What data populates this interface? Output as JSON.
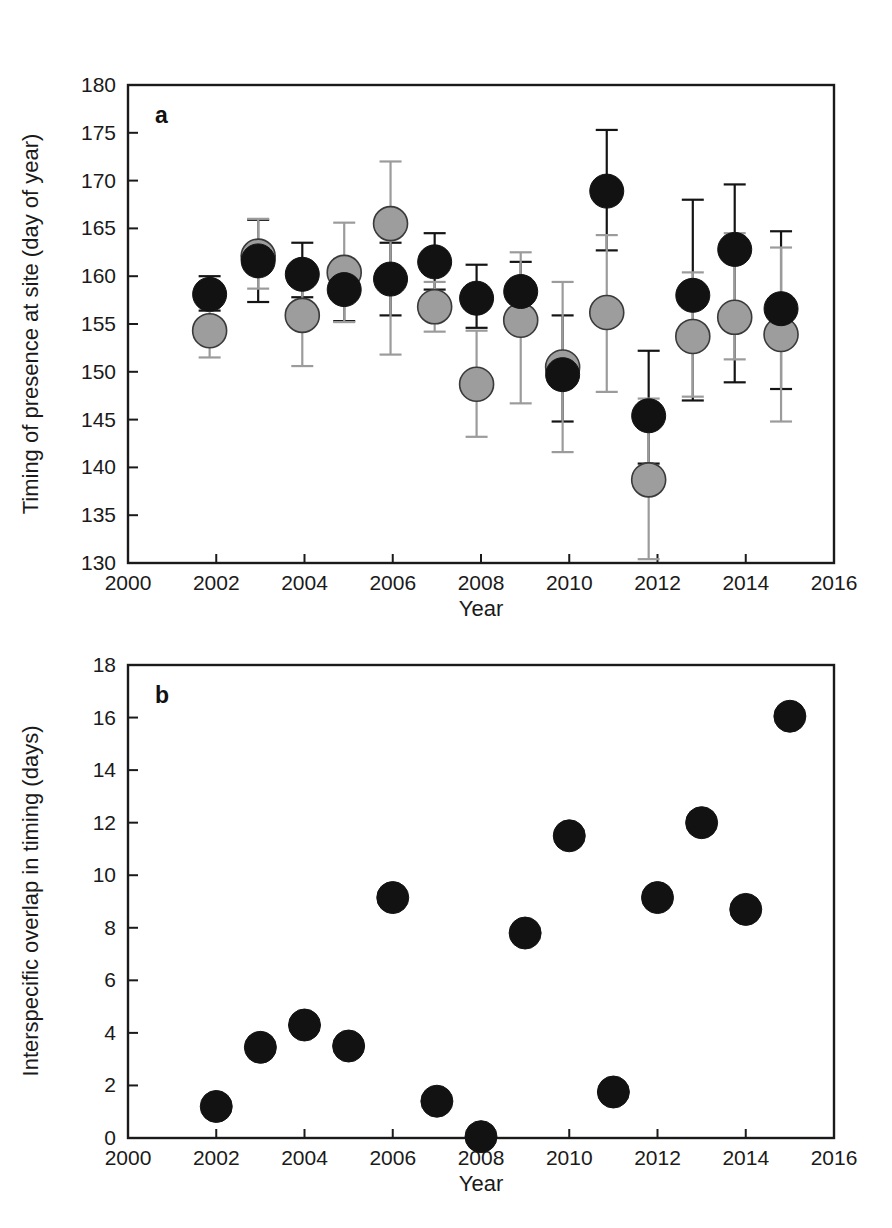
{
  "figure": {
    "panels": [
      {
        "letter": "a"
      },
      {
        "letter": "b"
      }
    ]
  },
  "chart_data": [
    {
      "type": "scatter",
      "panel": "a",
      "title": "",
      "xlabel": "Year",
      "ylabel": "Timing of presence at site (day of year)",
      "xlim": [
        2000,
        2016
      ],
      "ylim": [
        130,
        180
      ],
      "xticks": [
        2000,
        2002,
        2004,
        2006,
        2008,
        2010,
        2012,
        2014,
        2016
      ],
      "yticks": [
        130,
        135,
        140,
        145,
        150,
        155,
        160,
        165,
        170,
        175,
        180
      ],
      "grid": false,
      "legend": "none",
      "error_bars": "vertical with caps",
      "series": [
        {
          "name": "black-filled species",
          "color": "#121212",
          "x": [
            2001.85,
            2002.95,
            2003.95,
            2004.9,
            2005.95,
            2006.95,
            2007.9,
            2008.9,
            2009.85,
            2010.85,
            2011.8,
            2012.8,
            2013.75,
            2014.8
          ],
          "values": [
            158.1,
            161.6,
            160.2,
            158.6,
            159.7,
            161.5,
            157.7,
            158.4,
            149.7,
            168.9,
            145.4,
            158.0,
            162.8,
            156.6
          ],
          "err_low": [
            156.4,
            157.3,
            157.8,
            155.3,
            155.9,
            158.6,
            154.6,
            155.2,
            144.8,
            162.7,
            140.4,
            147.0,
            148.9,
            148.2
          ],
          "err_high": [
            160.0,
            165.9,
            163.5,
            161.8,
            163.5,
            164.5,
            161.2,
            161.5,
            155.9,
            175.3,
            152.2,
            168.0,
            169.6,
            164.7
          ]
        },
        {
          "name": "grey-filled species",
          "color": "#9d9d9d",
          "x": [
            2001.85,
            2002.95,
            2003.95,
            2004.9,
            2005.95,
            2006.95,
            2007.9,
            2008.9,
            2009.85,
            2010.85,
            2011.8,
            2012.8,
            2013.75,
            2014.8
          ],
          "values": [
            154.3,
            162.1,
            155.9,
            160.4,
            165.5,
            156.8,
            148.7,
            155.4,
            150.5,
            156.2,
            138.7,
            153.7,
            155.7,
            153.9
          ],
          "err_low": [
            151.5,
            158.7,
            150.6,
            155.2,
            151.8,
            154.2,
            143.2,
            146.7,
            141.6,
            147.9,
            130.4,
            147.4,
            151.3,
            144.8
          ],
          "err_high": [
            157.0,
            166.0,
            161.2,
            165.6,
            172.0,
            159.4,
            154.3,
            162.5,
            159.4,
            164.3,
            147.2,
            160.4,
            164.5,
            163.0
          ]
        }
      ]
    },
    {
      "type": "scatter",
      "panel": "b",
      "title": "",
      "xlabel": "Year",
      "ylabel": "Interspecific overlap in timing (days)",
      "xlim": [
        2000,
        2016
      ],
      "ylim": [
        0,
        18
      ],
      "xticks": [
        2000,
        2002,
        2004,
        2006,
        2008,
        2010,
        2012,
        2014,
        2016
      ],
      "yticks": [
        0,
        2,
        4,
        6,
        8,
        10,
        12,
        14,
        16,
        18
      ],
      "grid": false,
      "legend": "none",
      "series": [
        {
          "name": "interspecific overlap",
          "color": "#121212",
          "x": [
            2002,
            2003,
            2004,
            2005,
            2006,
            2007,
            2008,
            2009,
            2010,
            2011,
            2012,
            2013,
            2014,
            2015
          ],
          "values": [
            1.2,
            3.45,
            4.3,
            3.5,
            9.15,
            1.4,
            0.05,
            7.8,
            11.5,
            1.75,
            9.15,
            12.0,
            8.7,
            16.05
          ]
        }
      ]
    }
  ]
}
